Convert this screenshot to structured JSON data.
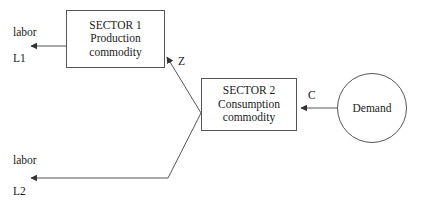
{
  "diagram": {
    "stroke_color": "#555555",
    "text_color": "#1a1a1a",
    "background_color": "#ffffff",
    "nodes": {
      "sector1": {
        "name": "SECTOR 1",
        "line1": "SECTOR 1",
        "line2": "Production",
        "line3": "commodity",
        "shape": "rectangle"
      },
      "sector2": {
        "name": "SECTOR 2",
        "line1": "SECTOR 2",
        "line2": "Consumption",
        "line3": "commodity",
        "shape": "rectangle"
      },
      "demand": {
        "label": "Demand",
        "shape": "circle"
      }
    },
    "edges": {
      "z_flow": {
        "label": "Z",
        "from": "SECTOR 2",
        "to": "SECTOR 1"
      },
      "c_flow": {
        "label": "C",
        "from": "Demand",
        "to": "SECTOR 2"
      },
      "labor1_flow": {
        "label": "labor",
        "sub_label": "L1",
        "from": "SECTOR 1",
        "to": "labor"
      },
      "labor2_flow": {
        "label": "labor",
        "sub_label": "L2",
        "from": "SECTOR 2",
        "to": "labor"
      }
    }
  }
}
